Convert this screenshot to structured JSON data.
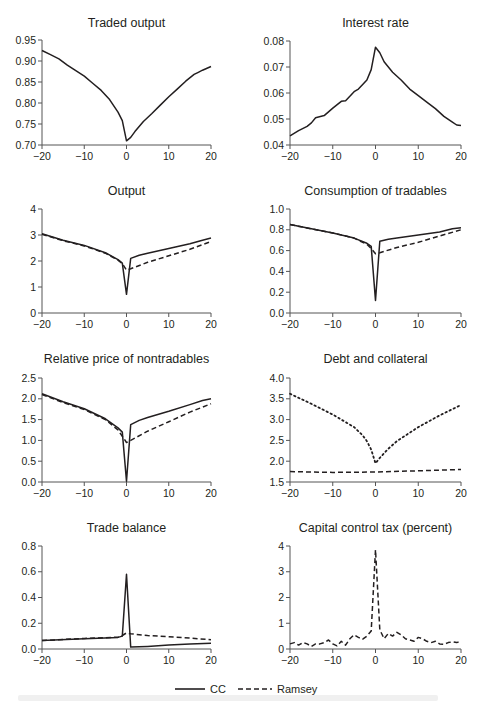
{
  "legend": {
    "items": [
      {
        "label": "CC",
        "style": "solid"
      },
      {
        "label": "Ramsey",
        "style": "dashed"
      }
    ]
  },
  "chart_data": [
    {
      "id": "traded-output",
      "type": "line",
      "title": "Traded output",
      "xlim": [
        -20,
        20
      ],
      "ylim": [
        0.7,
        0.95
      ],
      "xticks": [
        -20,
        -10,
        0,
        10,
        20
      ],
      "yticks": [
        0.7,
        0.75,
        0.8,
        0.85,
        0.9,
        0.95
      ],
      "ytick_labels": [
        "0.70",
        "0.75",
        "0.80",
        "0.85",
        "0.90",
        "0.95"
      ],
      "series": [
        {
          "name": "CC",
          "style": "solid",
          "x": [
            -20,
            -18,
            -16,
            -14,
            -12,
            -10,
            -8,
            -6,
            -4,
            -2,
            -1,
            0,
            1,
            2,
            4,
            6,
            8,
            10,
            12,
            14,
            16,
            17,
            18,
            20
          ],
          "values": [
            0.925,
            0.915,
            0.905,
            0.89,
            0.877,
            0.864,
            0.847,
            0.83,
            0.808,
            0.778,
            0.758,
            0.71,
            0.718,
            0.732,
            0.756,
            0.775,
            0.795,
            0.815,
            0.833,
            0.852,
            0.868,
            0.873,
            0.878,
            0.887
          ]
        }
      ]
    },
    {
      "id": "interest-rate",
      "type": "line",
      "title": "Interest rate",
      "xlim": [
        -20,
        20
      ],
      "ylim": [
        0.04,
        0.08
      ],
      "xticks": [
        -20,
        -10,
        0,
        10,
        20
      ],
      "yticks": [
        0.04,
        0.05,
        0.06,
        0.07,
        0.08
      ],
      "ytick_labels": [
        "0.04",
        "0.05",
        "0.06",
        "0.07",
        "0.08"
      ],
      "series": [
        {
          "name": "CC",
          "style": "solid",
          "x": [
            -20,
            -18,
            -16,
            -15,
            -14,
            -12,
            -10,
            -8,
            -7,
            -5,
            -4,
            -2,
            -1,
            0,
            1,
            2,
            4,
            6,
            8,
            10,
            12,
            14,
            16,
            18,
            19,
            20
          ],
          "values": [
            0.0435,
            0.0455,
            0.0472,
            0.0485,
            0.0505,
            0.0513,
            0.0542,
            0.0568,
            0.057,
            0.0605,
            0.0615,
            0.065,
            0.069,
            0.0776,
            0.0755,
            0.072,
            0.068,
            0.065,
            0.0615,
            0.059,
            0.0565,
            0.054,
            0.051,
            0.0488,
            0.0477,
            0.0475
          ]
        }
      ]
    },
    {
      "id": "output",
      "type": "line",
      "title": "Output",
      "xlim": [
        -20,
        20
      ],
      "ylim": [
        0,
        4
      ],
      "xticks": [
        -20,
        -10,
        0,
        10,
        20
      ],
      "yticks": [
        0,
        1,
        2,
        3,
        4
      ],
      "ytick_labels": [
        "0",
        "1",
        "2",
        "3",
        "4"
      ],
      "series": [
        {
          "name": "CC",
          "style": "solid",
          "x": [
            -20,
            -15,
            -10,
            -5,
            -2,
            -1,
            0,
            1,
            3,
            5,
            10,
            15,
            18,
            20
          ],
          "values": [
            3.05,
            2.8,
            2.6,
            2.32,
            2.05,
            1.92,
            0.72,
            2.1,
            2.22,
            2.3,
            2.48,
            2.66,
            2.8,
            2.88
          ]
        },
        {
          "name": "Ramsey",
          "style": "dashed",
          "x": [
            -20,
            -15,
            -10,
            -5,
            -2,
            -1,
            0,
            1,
            5,
            10,
            15,
            20
          ],
          "values": [
            3.03,
            2.78,
            2.58,
            2.3,
            2.03,
            1.9,
            1.65,
            1.7,
            1.95,
            2.2,
            2.45,
            2.75
          ]
        }
      ]
    },
    {
      "id": "consumption-of-tradables",
      "type": "line",
      "title": "Consumption of tradables",
      "xlim": [
        -20,
        20
      ],
      "ylim": [
        0.0,
        1.0
      ],
      "xticks": [
        -20,
        -10,
        0,
        10,
        20
      ],
      "yticks": [
        0.0,
        0.2,
        0.4,
        0.6,
        0.8,
        1.0
      ],
      "ytick_labels": [
        "0.0",
        "0.2",
        "0.4",
        "0.6",
        "0.8",
        "1.0"
      ],
      "series": [
        {
          "name": "CC",
          "style": "solid",
          "x": [
            -20,
            -15,
            -10,
            -5,
            -2,
            -1,
            0,
            1,
            3,
            5,
            10,
            15,
            18,
            20
          ],
          "values": [
            0.85,
            0.81,
            0.77,
            0.72,
            0.67,
            0.64,
            0.12,
            0.69,
            0.71,
            0.72,
            0.75,
            0.78,
            0.81,
            0.82
          ]
        },
        {
          "name": "Ramsey",
          "style": "dashed",
          "x": [
            -20,
            -15,
            -10,
            -5,
            -2,
            -1,
            0,
            1,
            5,
            10,
            15,
            20
          ],
          "values": [
            0.85,
            0.81,
            0.77,
            0.72,
            0.66,
            0.62,
            0.57,
            0.58,
            0.63,
            0.68,
            0.74,
            0.8
          ]
        }
      ]
    },
    {
      "id": "relative-price-of-nontradables",
      "type": "line",
      "title": "Relative price of nontradables",
      "xlim": [
        -20,
        20
      ],
      "ylim": [
        0.0,
        2.5
      ],
      "xticks": [
        -20,
        -10,
        0,
        10,
        20
      ],
      "yticks": [
        0.0,
        0.5,
        1.0,
        1.5,
        2.0,
        2.5
      ],
      "ytick_labels": [
        "0.0",
        "0.5",
        "1.0",
        "1.5",
        "2.0",
        "2.5"
      ],
      "series": [
        {
          "name": "CC",
          "style": "solid",
          "x": [
            -20,
            -15,
            -10,
            -5,
            -2,
            -1,
            0,
            1,
            3,
            5,
            10,
            15,
            18,
            20
          ],
          "values": [
            2.12,
            1.93,
            1.76,
            1.52,
            1.3,
            1.2,
            0.02,
            1.38,
            1.48,
            1.55,
            1.7,
            1.86,
            1.96,
            2.0
          ]
        },
        {
          "name": "Ramsey",
          "style": "dashed",
          "x": [
            -20,
            -15,
            -10,
            -5,
            -2,
            -1,
            0,
            1,
            5,
            10,
            15,
            20
          ],
          "values": [
            2.1,
            1.91,
            1.74,
            1.5,
            1.25,
            1.1,
            0.95,
            1.0,
            1.22,
            1.45,
            1.68,
            1.88
          ]
        }
      ]
    },
    {
      "id": "debt-and-collateral",
      "type": "line",
      "title": "Debt and collateral",
      "xlim": [
        -20,
        20
      ],
      "ylim": [
        1.5,
        4.0
      ],
      "xticks": [
        -20,
        -10,
        0,
        10,
        20
      ],
      "yticks": [
        1.5,
        2.0,
        2.5,
        3.0,
        3.5,
        4.0
      ],
      "ytick_labels": [
        "1.5",
        "2.0",
        "2.5",
        "3.0",
        "3.5",
        "4.0"
      ],
      "series": [
        {
          "name": "Collateral",
          "style": "dotted",
          "x": [
            -20,
            -15,
            -10,
            -5,
            -3,
            -2,
            -1,
            0,
            1,
            3,
            5,
            10,
            15,
            20
          ],
          "values": [
            3.62,
            3.38,
            3.12,
            2.82,
            2.62,
            2.48,
            2.28,
            1.95,
            2.08,
            2.3,
            2.48,
            2.82,
            3.1,
            3.35
          ]
        },
        {
          "name": "Debt",
          "style": "dashed",
          "x": [
            -20,
            -10,
            0,
            10,
            20
          ],
          "values": [
            1.75,
            1.73,
            1.74,
            1.77,
            1.8
          ]
        }
      ]
    },
    {
      "id": "trade-balance",
      "type": "line",
      "title": "Trade balance",
      "xlim": [
        -20,
        20
      ],
      "ylim": [
        0.0,
        0.8
      ],
      "xticks": [
        -20,
        -10,
        0,
        10,
        20
      ],
      "yticks": [
        0.0,
        0.2,
        0.4,
        0.6,
        0.8
      ],
      "ytick_labels": [
        "0.0",
        "0.2",
        "0.4",
        "0.6",
        "0.8"
      ],
      "series": [
        {
          "name": "CC",
          "style": "solid",
          "x": [
            -20,
            -10,
            -2,
            -1,
            0,
            1,
            5,
            10,
            15,
            20
          ],
          "values": [
            0.065,
            0.08,
            0.09,
            0.1,
            0.58,
            0.015,
            0.02,
            0.03,
            0.04,
            0.045
          ]
        },
        {
          "name": "Ramsey",
          "style": "dashed",
          "x": [
            -20,
            -10,
            -2,
            -1,
            0,
            1,
            5,
            10,
            15,
            20
          ],
          "values": [
            0.065,
            0.082,
            0.092,
            0.105,
            0.125,
            0.118,
            0.105,
            0.095,
            0.085,
            0.072
          ]
        }
      ]
    },
    {
      "id": "capital-control-tax",
      "type": "line",
      "title": "Capital control tax (percent)",
      "xlim": [
        -20,
        20
      ],
      "ylim": [
        0,
        4
      ],
      "xticks": [
        -20,
        -10,
        0,
        10,
        20
      ],
      "yticks": [
        0,
        1,
        2,
        3,
        4
      ],
      "ytick_labels": [
        "0",
        "1",
        "2",
        "3",
        "4"
      ],
      "series": [
        {
          "name": "Ramsey",
          "style": "dashed",
          "x": [
            -20,
            -19,
            -18,
            -17,
            -16,
            -15,
            -14,
            -13,
            -12,
            -11,
            -10,
            -9,
            -8,
            -7,
            -6,
            -5,
            -4,
            -3,
            -2,
            -1,
            0,
            1,
            2,
            3,
            4,
            5,
            6,
            7,
            8,
            9,
            10,
            11,
            12,
            13,
            14,
            15,
            16,
            17,
            18,
            19,
            20
          ],
          "values": [
            0.2,
            0.25,
            0.15,
            0.25,
            0.2,
            0.1,
            0.2,
            0.2,
            0.25,
            0.35,
            0.2,
            0.12,
            0.3,
            0.15,
            0.4,
            0.55,
            0.45,
            0.38,
            0.5,
            0.7,
            3.85,
            0.75,
            0.4,
            0.6,
            0.5,
            0.65,
            0.55,
            0.4,
            0.35,
            0.3,
            0.45,
            0.4,
            0.3,
            0.25,
            0.3,
            0.2,
            0.18,
            0.25,
            0.28,
            0.25,
            0.3
          ]
        }
      ]
    }
  ],
  "layout": {
    "panels": [
      {
        "x0": 42,
        "x1": 211,
        "y_top": 40,
        "y_bot": 145,
        "title_y": 27
      },
      {
        "x0": 290,
        "x1": 461,
        "y_top": 41,
        "y_bot": 145,
        "title_y": 27
      },
      {
        "x0": 42,
        "x1": 211,
        "y_top": 209,
        "y_bot": 313,
        "title_y": 195
      },
      {
        "x0": 290,
        "x1": 461,
        "y_top": 209,
        "y_bot": 313,
        "title_y": 195
      },
      {
        "x0": 42,
        "x1": 211,
        "y_top": 378,
        "y_bot": 482,
        "title_y": 363
      },
      {
        "x0": 290,
        "x1": 461,
        "y_top": 378,
        "y_bot": 482,
        "title_y": 363
      },
      {
        "x0": 42,
        "x1": 211,
        "y_top": 546,
        "y_bot": 649,
        "title_y": 532
      },
      {
        "x0": 290,
        "x1": 461,
        "y_top": 546,
        "y_bot": 649,
        "title_y": 532
      }
    ],
    "line_color": "#231f20"
  }
}
